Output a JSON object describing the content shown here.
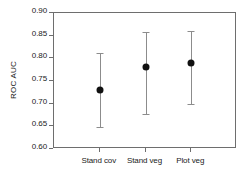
{
  "chart_data": {
    "type": "scatter",
    "title": "",
    "xlabel": "",
    "ylabel": "ROC AUC",
    "categories": [
      "Stand cov",
      "Stand veg",
      "Plot veg"
    ],
    "values": [
      0.731,
      0.78,
      0.789
    ],
    "errors_low": [
      0.649,
      0.677,
      0.699
    ],
    "errors_high": [
      0.812,
      0.858,
      0.86
    ],
    "ylim": [
      0.6,
      0.9
    ],
    "yticks": [
      "0.60",
      "0.65",
      "0.70",
      "0.75",
      "0.80",
      "0.85",
      "0.90"
    ],
    "ytick_values": [
      0.6,
      0.65,
      0.7,
      0.75,
      0.8,
      0.85,
      0.9
    ],
    "grid": false,
    "legend": "none",
    "marker_color": "#111111",
    "errorbar_color": "#8c8c8c",
    "axis_color": "#6e6e6e",
    "background": "#ffffff"
  }
}
